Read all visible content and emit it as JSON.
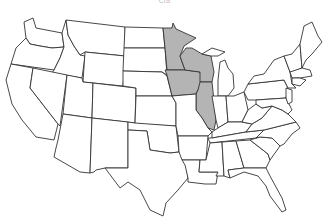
{
  "caption": "CIS",
  "map": {
    "type": "US states outline map",
    "highlight_color": "#b4b4b4",
    "base_color": "#ffffff",
    "stroke_color": "#333333",
    "highlighted_states": [
      "Minnesota",
      "Wisconsin",
      "Iowa",
      "Illinois"
    ]
  }
}
